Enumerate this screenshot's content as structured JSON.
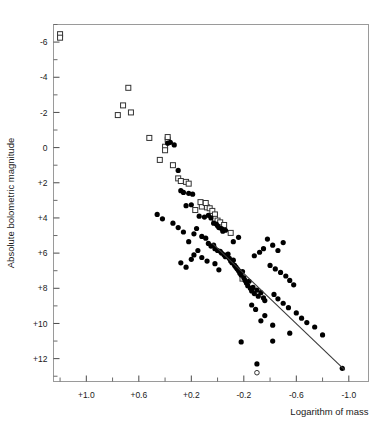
{
  "chart_data": {
    "type": "scatter",
    "title": "",
    "xlabel": "Logarithm of mass",
    "ylabel": "Absolute bolometric magnitude",
    "xlim": [
      1.25,
      -1.15
    ],
    "ylim": [
      -7.0,
      13.3
    ],
    "x_inverted": true,
    "y_inverted": true,
    "grid": false,
    "legend": "none",
    "xticks_major": [
      1.0,
      0.6,
      0.2,
      -0.2,
      -0.6,
      -1.0
    ],
    "xticklabels": [
      "+1.0",
      "+0.6",
      "+0.2",
      "-0.2",
      "-0.6",
      "-1.0"
    ],
    "xticks_minor": [
      1.2,
      0.8,
      0.4,
      0.0,
      -0.4,
      -0.8
    ],
    "yticks_major": [
      -6,
      -4,
      -2,
      0,
      2,
      4,
      6,
      8,
      10,
      12
    ],
    "yticklabels": [
      "-6",
      "-4",
      "-2",
      "0",
      "+2",
      "+4",
      "+6",
      "+8",
      "+10",
      "+12"
    ],
    "yticks_minor": [
      -7,
      -5,
      -3,
      -1,
      1,
      3,
      5,
      7,
      9,
      11,
      13
    ],
    "series": [
      {
        "name": "open-squares",
        "marker": "open-square",
        "color": "#333333",
        "points": [
          [
            1.2,
            -6.45
          ],
          [
            1.2,
            -6.25
          ],
          [
            0.68,
            -3.4
          ],
          [
            0.76,
            -1.85
          ],
          [
            0.72,
            -2.4
          ],
          [
            0.66,
            -2.0
          ],
          [
            0.44,
            0.7
          ],
          [
            0.4,
            -0.05
          ],
          [
            0.4,
            0.15
          ],
          [
            0.52,
            -0.55
          ],
          [
            0.38,
            -0.45
          ],
          [
            0.38,
            -0.6
          ],
          [
            0.3,
            1.75
          ],
          [
            0.28,
            1.9
          ],
          [
            0.24,
            1.95
          ],
          [
            0.22,
            2.05
          ],
          [
            0.17,
            3.55
          ],
          [
            0.12,
            3.35
          ],
          [
            0.08,
            3.4
          ],
          [
            0.06,
            3.45
          ],
          [
            0.04,
            3.6
          ],
          [
            0.02,
            3.8
          ],
          [
            0.02,
            4.05
          ],
          [
            0.0,
            4.15
          ],
          [
            -0.02,
            4.25
          ],
          [
            -0.05,
            4.4
          ],
          [
            0.13,
            3.1
          ],
          [
            0.09,
            3.15
          ],
          [
            0.34,
            1.0
          ],
          [
            -0.1,
            4.85
          ],
          [
            -0.19,
            7.45
          ]
        ]
      },
      {
        "name": "filled-circles",
        "marker": "filled-circle",
        "color": "#000000",
        "points": [
          [
            0.33,
            -0.15
          ],
          [
            0.38,
            -0.25
          ],
          [
            0.36,
            -0.3
          ],
          [
            0.3,
            1.3
          ],
          [
            0.26,
            2.55
          ],
          [
            0.22,
            2.6
          ],
          [
            0.19,
            2.65
          ],
          [
            0.24,
            3.3
          ],
          [
            0.2,
            3.25
          ],
          [
            0.28,
            2.45
          ],
          [
            0.14,
            3.9
          ],
          [
            0.1,
            3.95
          ],
          [
            0.07,
            3.85
          ],
          [
            0.05,
            4.0
          ],
          [
            0.03,
            4.3
          ],
          [
            0.01,
            4.35
          ],
          [
            0.0,
            4.45
          ],
          [
            -0.01,
            4.55
          ],
          [
            -0.03,
            4.6
          ],
          [
            -0.04,
            4.75
          ],
          [
            -0.06,
            4.7
          ],
          [
            0.16,
            4.6
          ],
          [
            0.18,
            4.9
          ],
          [
            0.12,
            5.05
          ],
          [
            0.09,
            5.15
          ],
          [
            0.22,
            5.35
          ],
          [
            0.26,
            4.8
          ],
          [
            0.3,
            4.55
          ],
          [
            0.34,
            4.3
          ],
          [
            0.07,
            5.45
          ],
          [
            0.05,
            5.6
          ],
          [
            0.03,
            5.55
          ],
          [
            0.02,
            5.75
          ],
          [
            0.0,
            5.85
          ],
          [
            -0.02,
            5.9
          ],
          [
            -0.03,
            6.0
          ],
          [
            -0.05,
            6.1
          ],
          [
            -0.06,
            6.2
          ],
          [
            -0.08,
            6.05
          ],
          [
            -0.09,
            6.3
          ],
          [
            -0.1,
            6.45
          ],
          [
            -0.11,
            6.55
          ],
          [
            -0.12,
            6.4
          ],
          [
            -0.13,
            6.7
          ],
          [
            -0.14,
            6.8
          ],
          [
            -0.15,
            6.9
          ],
          [
            -0.16,
            7.0
          ],
          [
            -0.17,
            7.15
          ],
          [
            -0.18,
            7.25
          ],
          [
            -0.19,
            7.05
          ],
          [
            -0.2,
            7.4
          ],
          [
            -0.21,
            7.55
          ],
          [
            -0.22,
            7.7
          ],
          [
            -0.23,
            7.85
          ],
          [
            -0.24,
            7.6
          ],
          [
            -0.25,
            8.0
          ],
          [
            -0.26,
            8.15
          ],
          [
            -0.27,
            7.95
          ],
          [
            -0.28,
            8.3
          ],
          [
            -0.3,
            8.1
          ],
          [
            -0.31,
            8.45
          ],
          [
            -0.33,
            8.25
          ],
          [
            -0.35,
            8.55
          ],
          [
            -0.36,
            8.7
          ],
          [
            0.12,
            6.25
          ],
          [
            0.08,
            6.45
          ],
          [
            0.02,
            6.6
          ],
          [
            -0.01,
            6.95
          ],
          [
            0.15,
            5.85
          ],
          [
            0.18,
            6.1
          ],
          [
            0.2,
            6.35
          ],
          [
            -0.38,
            5.2
          ],
          [
            -0.42,
            5.55
          ],
          [
            -0.46,
            5.85
          ],
          [
            -0.5,
            5.4
          ],
          [
            -0.35,
            5.75
          ],
          [
            -0.32,
            5.95
          ],
          [
            -0.28,
            6.15
          ],
          [
            -0.4,
            6.7
          ],
          [
            -0.44,
            6.9
          ],
          [
            -0.48,
            7.1
          ],
          [
            -0.52,
            7.3
          ],
          [
            -0.55,
            7.55
          ],
          [
            -0.58,
            7.8
          ],
          [
            -0.43,
            8.35
          ],
          [
            -0.46,
            8.6
          ],
          [
            -0.5,
            8.85
          ],
          [
            -0.54,
            9.1
          ],
          [
            -0.6,
            9.4
          ],
          [
            -0.64,
            9.7
          ],
          [
            -0.68,
            9.95
          ],
          [
            -0.74,
            10.2
          ],
          [
            -0.8,
            10.65
          ],
          [
            -0.95,
            12.55
          ],
          [
            -0.55,
            10.55
          ],
          [
            -0.33,
            9.85
          ],
          [
            -0.42,
            10.1
          ],
          [
            -0.18,
            11.05
          ],
          [
            -0.42,
            11.0
          ],
          [
            -0.3,
            12.3
          ],
          [
            -0.26,
            8.95
          ],
          [
            -0.29,
            9.2
          ],
          [
            -0.36,
            9.55
          ],
          [
            0.24,
            6.8
          ],
          [
            0.28,
            6.55
          ],
          [
            -0.12,
            5.35
          ],
          [
            -0.16,
            5.1
          ],
          [
            0.42,
            4.05
          ],
          [
            0.46,
            3.8
          ]
        ]
      },
      {
        "name": "open-circle",
        "marker": "open-circle",
        "color": "#333333",
        "points": [
          [
            -0.3,
            12.8
          ]
        ]
      }
    ],
    "fit_line": {
      "label": "regression-line",
      "x1": 0.04,
      "y1": 5.45,
      "x2": -0.97,
      "y2": 12.65,
      "color": "#3a3a3a"
    }
  }
}
